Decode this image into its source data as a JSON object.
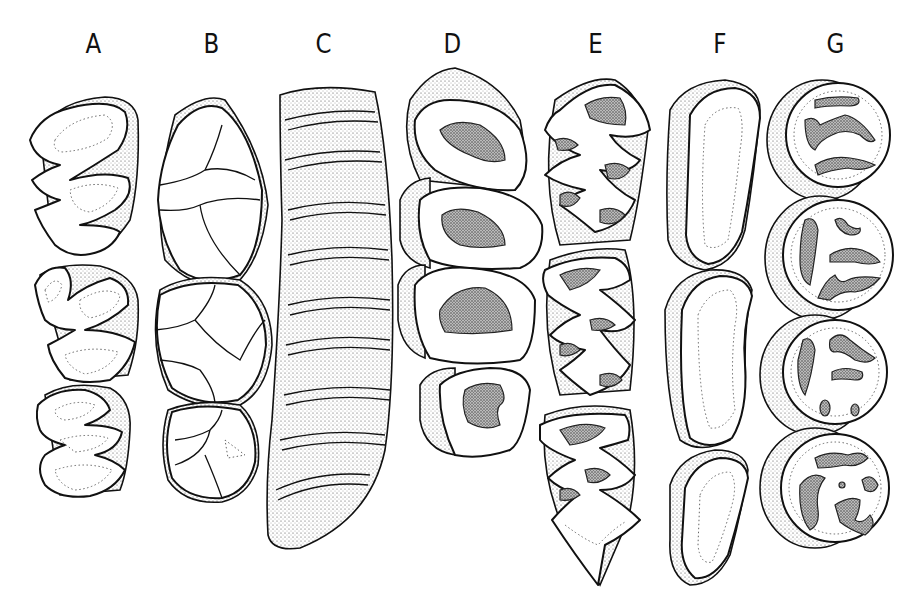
{
  "figure": {
    "type": "scientific illustration",
    "panels": [
      {
        "label": "A",
        "description": "three teeth with zigzag folded outlines and dotted inner contours"
      },
      {
        "label": "B",
        "description": "three bunodont teeth with rounded cusps"
      },
      {
        "label": "C",
        "description": "elongated tooth with many transverse stippled lamellae"
      },
      {
        "label": "D",
        "description": "four rounded-triangular teeth with dark stippled central basins"
      },
      {
        "label": "E",
        "description": "three teeth with alternating triangular prisms and stippled dentine fields, pointed posterior end"
      },
      {
        "label": "F",
        "description": "three elongated kidney-shaped teeth with dotted inner rims"
      },
      {
        "label": "G",
        "description": "four circular teeth with irregular stippled enamel islands"
      }
    ]
  },
  "colors": {
    "background": "#ffffff",
    "ink": "#111111",
    "stipple": "#555555"
  }
}
